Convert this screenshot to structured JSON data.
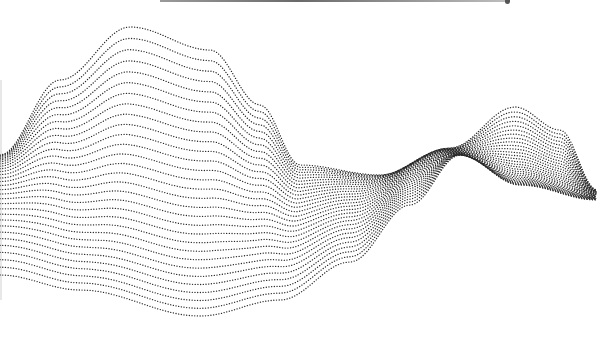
{
  "illustration": {
    "title": "",
    "description": "dotted wave lines",
    "line_count": 30,
    "dot_color": "#2a2a2a",
    "background": "#ffffff",
    "curve_top": [
      [
        0,
        155
      ],
      [
        60,
        80
      ],
      [
        130,
        27
      ],
      [
        210,
        50
      ],
      [
        260,
        105
      ],
      [
        300,
        165
      ],
      [
        380,
        175
      ],
      [
        450,
        148
      ],
      [
        515,
        107
      ],
      [
        560,
        130
      ],
      [
        597,
        190
      ]
    ],
    "curve_bottom": [
      [
        0,
        275
      ],
      [
        80,
        290
      ],
      [
        200,
        316
      ],
      [
        280,
        300
      ],
      [
        350,
        262
      ],
      [
        410,
        205
      ],
      [
        460,
        155
      ],
      [
        520,
        185
      ],
      [
        597,
        200
      ]
    ],
    "curve_mid_twist": [
      [
        0,
        160
      ],
      [
        100,
        190
      ],
      [
        190,
        205
      ],
      [
        280,
        200
      ],
      [
        360,
        185
      ],
      [
        440,
        150
      ],
      [
        520,
        180
      ],
      [
        597,
        195
      ]
    ]
  },
  "top_bar": {
    "visible": true
  }
}
